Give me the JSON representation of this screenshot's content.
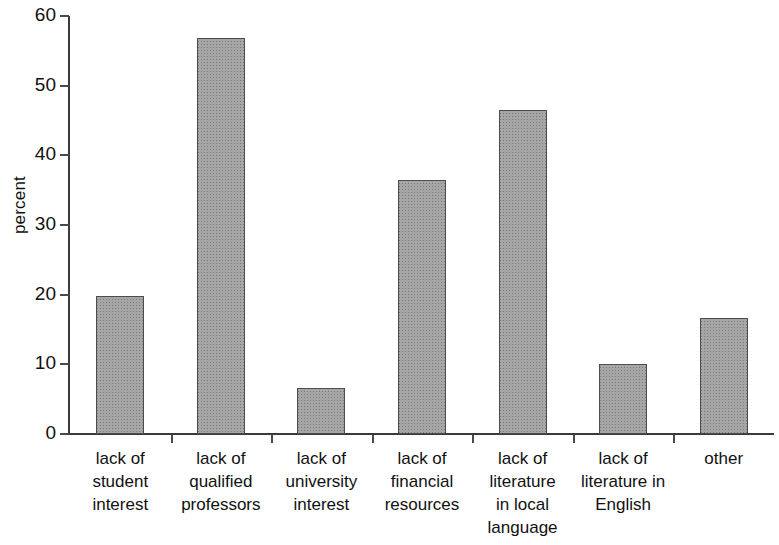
{
  "chart_data": {
    "type": "bar",
    "title": "",
    "xlabel": "",
    "ylabel": "percent",
    "ylim": [
      0,
      60
    ],
    "yticks": [
      0,
      10,
      20,
      30,
      40,
      50,
      60
    ],
    "ytick_labels": [
      "0",
      "10",
      "20",
      "30",
      "40",
      "50",
      "60"
    ],
    "grid": false,
    "legend": "none",
    "categories": [
      "lack of\nstudent\ninterest",
      "lack of\nqualified\nprofessors",
      "lack of\nuniversity\ninterest",
      "lack of\nfinancial\nresources",
      "lack of\nliterature\nin local\nlanguage",
      "lack of\nliterature in\nEnglish",
      "other"
    ],
    "values": [
      19.8,
      56.8,
      6.6,
      36.5,
      46.5,
      10.1,
      16.6
    ],
    "bar_color": "#a6a6a6",
    "bar_border_color": "#4c4c4c",
    "axis_color": "#3a3a3a"
  }
}
